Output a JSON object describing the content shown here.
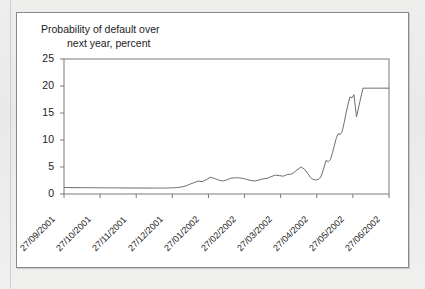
{
  "figure": {
    "title_line1": "Probability of default over",
    "title_line2": "next year, percent",
    "background": "#ffffff",
    "border_color": "#8a8a8a",
    "line_color": "#6e6e6e",
    "axis_color": "#7a7a7a"
  },
  "chart_data": {
    "type": "line",
    "title": "Probability of default over next year, percent",
    "xlabel": "",
    "ylabel": "Probability of default over next year, percent",
    "grid": false,
    "legend": "none",
    "ylim": [
      0,
      25
    ],
    "yticks": [
      0,
      5,
      10,
      15,
      20,
      25
    ],
    "ytick_labels": [
      "0",
      "5",
      "10",
      "15",
      "20",
      "25"
    ],
    "xtick_labels": [
      "27/09/2001",
      "27/10/2001",
      "27/11/2001",
      "27/12/2001",
      "27/01/2002",
      "27/02/2002",
      "27/03/2002",
      "27/04/2002",
      "27/05/2002",
      "27/06/2002"
    ],
    "xlim": [
      "27/09/2001",
      "27/06/2002"
    ],
    "series": [
      {
        "name": "Probability of default",
        "color": "#6e6e6e",
        "x_fraction": [
          0.0,
          0.012,
          0.025,
          0.037,
          0.05,
          0.062,
          0.075,
          0.087,
          0.1,
          0.112,
          0.125,
          0.137,
          0.15,
          0.162,
          0.175,
          0.187,
          0.2,
          0.212,
          0.225,
          0.237,
          0.25,
          0.262,
          0.275,
          0.287,
          0.3,
          0.312,
          0.325,
          0.337,
          0.35,
          0.362,
          0.375,
          0.387,
          0.4,
          0.412,
          0.425,
          0.437,
          0.45,
          0.462,
          0.475,
          0.487,
          0.5,
          0.512,
          0.525,
          0.537,
          0.55,
          0.562,
          0.575,
          0.587,
          0.6,
          0.612,
          0.625,
          0.637,
          0.65,
          0.662,
          0.675,
          0.687,
          0.7,
          0.71,
          0.72,
          0.73,
          0.74,
          0.75,
          0.758,
          0.766,
          0.774,
          0.782,
          0.79,
          0.798,
          0.806,
          0.814,
          0.82,
          0.826,
          0.832,
          0.838,
          0.844,
          0.85,
          0.856,
          0.862,
          0.868,
          0.874,
          0.88,
          0.886,
          0.892,
          0.9,
          0.91,
          0.92,
          0.94,
          0.96,
          0.98,
          1.0
        ],
        "values": [
          1.2,
          1.2,
          1.18,
          1.18,
          1.17,
          1.17,
          1.16,
          1.16,
          1.15,
          1.15,
          1.14,
          1.14,
          1.13,
          1.13,
          1.12,
          1.12,
          1.12,
          1.11,
          1.11,
          1.1,
          1.1,
          1.1,
          1.1,
          1.1,
          1.1,
          1.1,
          1.12,
          1.15,
          1.2,
          1.3,
          1.5,
          1.8,
          2.1,
          2.4,
          2.3,
          2.6,
          3.1,
          2.9,
          2.6,
          2.4,
          2.6,
          2.9,
          3.0,
          3.0,
          2.9,
          2.7,
          2.5,
          2.4,
          2.6,
          2.8,
          2.9,
          3.2,
          3.5,
          3.4,
          3.3,
          3.6,
          3.7,
          4.1,
          4.6,
          5.0,
          4.6,
          3.8,
          3.1,
          2.7,
          2.6,
          2.7,
          3.1,
          4.5,
          6.2,
          6.0,
          6.4,
          7.6,
          9.0,
          10.4,
          11.2,
          11.0,
          11.6,
          13.2,
          15.0,
          16.6,
          18.0,
          17.8,
          18.4,
          14.3,
          17.0,
          19.6,
          19.6,
          19.6,
          19.6,
          19.6
        ]
      }
    ]
  }
}
